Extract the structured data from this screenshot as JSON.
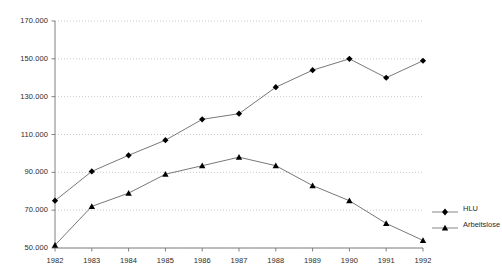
{
  "chart_data": {
    "type": "line",
    "title": "",
    "xlabel": "",
    "ylabel": "",
    "categories": [
      "1982",
      "1983",
      "1984",
      "1985",
      "1986",
      "1987",
      "1988",
      "1989",
      "1990",
      "1991",
      "1992"
    ],
    "ylim": [
      50000,
      170000
    ],
    "ytick_values": [
      50000,
      70000,
      90000,
      110000,
      130000,
      150000,
      170000
    ],
    "ytick_labels": [
      "50.000",
      "70.000",
      "90.000",
      "110.000",
      "130.000",
      "150.000",
      "170.000"
    ],
    "grid": true,
    "legend_position": "right",
    "series": [
      {
        "name": "HLU",
        "marker": "diamond",
        "color": "#000000",
        "values": [
          75000,
          90500,
          99000,
          107000,
          118000,
          121000,
          135000,
          144000,
          150000,
          140000,
          149000
        ]
      },
      {
        "name": "Arbeitslose",
        "marker": "triangle",
        "color": "#000000",
        "values": [
          51500,
          72000,
          79000,
          89000,
          93500,
          98000,
          93500,
          83000,
          75000,
          63000,
          54000
        ]
      }
    ]
  },
  "legend": {
    "items": [
      {
        "label": "HLU"
      },
      {
        "label": "Arbeitslose"
      }
    ]
  },
  "colors": {
    "axis": "#808080",
    "grid": "#b9b9c4",
    "series": "#000000",
    "background": "#ffffff"
  }
}
